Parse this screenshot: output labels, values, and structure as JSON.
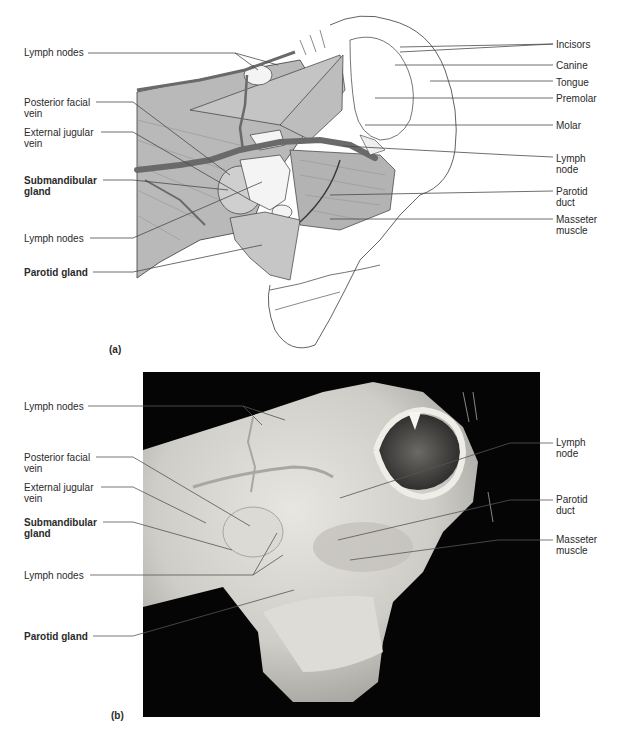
{
  "figure": {
    "panel_a": {
      "tag": "(a)",
      "type": "illustration",
      "left_labels": [
        {
          "id": "lymph-nodes-top",
          "text": "Lymph nodes",
          "bold": false
        },
        {
          "id": "posterior-facial-vein",
          "text": "Posterior facial\nvein",
          "bold": false
        },
        {
          "id": "external-jugular-vein",
          "text": "External jugular\nvein",
          "bold": false
        },
        {
          "id": "submandibular-gland",
          "text": "Submandibular\ngland",
          "bold": true
        },
        {
          "id": "lymph-nodes-lower",
          "text": "Lymph nodes",
          "bold": false
        },
        {
          "id": "parotid-gland",
          "text": "Parotid gland",
          "bold": true
        }
      ],
      "right_labels": [
        {
          "id": "incisors",
          "text": "Incisors"
        },
        {
          "id": "canine",
          "text": "Canine"
        },
        {
          "id": "tongue",
          "text": "Tongue"
        },
        {
          "id": "premolar",
          "text": "Premolar"
        },
        {
          "id": "molar",
          "text": "Molar"
        },
        {
          "id": "lymph-node",
          "text": "Lymph\nnode"
        },
        {
          "id": "parotid-duct",
          "text": "Parotid\nduct"
        },
        {
          "id": "masseter-muscle",
          "text": "Masseter\nmuscle"
        }
      ]
    },
    "panel_b": {
      "tag": "(b)",
      "type": "photograph",
      "left_labels": [
        {
          "id": "lymph-nodes-top",
          "text": "Lymph nodes",
          "bold": false
        },
        {
          "id": "posterior-facial-vein",
          "text": "Posterior facial\nvein",
          "bold": false
        },
        {
          "id": "external-jugular-vein",
          "text": "External jugular\nvein",
          "bold": false
        },
        {
          "id": "submandibular-gland",
          "text": "Submandibular\ngland",
          "bold": true
        },
        {
          "id": "lymph-nodes-lower",
          "text": "Lymph nodes",
          "bold": false
        },
        {
          "id": "parotid-gland",
          "text": "Parotid gland",
          "bold": true
        }
      ],
      "right_labels": [
        {
          "id": "lymph-node",
          "text": "Lymph\nnode"
        },
        {
          "id": "parotid-duct",
          "text": "Parotid\nduct"
        },
        {
          "id": "masseter-muscle",
          "text": "Masseter\nmuscle"
        }
      ]
    },
    "colors": {
      "muscle": "#b8b8b8",
      "vein": "#6a6a6a",
      "gland": "#c9c9c9",
      "outline": "#3a3a3a",
      "photo_bg": "#050505",
      "photo_tissue": "#d8d6d0"
    }
  }
}
